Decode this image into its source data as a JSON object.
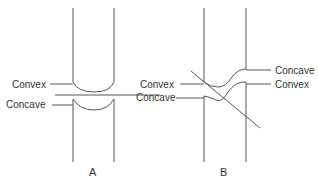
{
  "diagram": {
    "panels": [
      {
        "id": "A",
        "caption": "A",
        "labels_left": [
          "Convex",
          "Concave"
        ],
        "description": "Straight fracture line perpendicular to bone shaft; upper fragment end convex, lower fragment end concave"
      },
      {
        "id": "B",
        "caption": "B",
        "labels_left": [
          "Convex",
          "Concave"
        ],
        "labels_right": [
          "Concave",
          "Convex"
        ],
        "description": "Oblique line crossing bone; fragment ends with S-shaped curvature"
      }
    ],
    "colors": {
      "line": "#555555",
      "text": "#333333",
      "background": "#ffffff"
    }
  }
}
